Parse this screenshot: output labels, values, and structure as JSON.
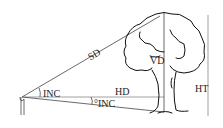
{
  "diagram": {
    "labels": {
      "sd": "SD",
      "vd": "VD",
      "hd": "HD",
      "ht": "HT",
      "inc_upper": "INC",
      "inc_lower": "°INC"
    },
    "colors": {
      "line": "#444444",
      "tree": "#111111",
      "reference": "#888888",
      "background": "#ffffff"
    }
  }
}
